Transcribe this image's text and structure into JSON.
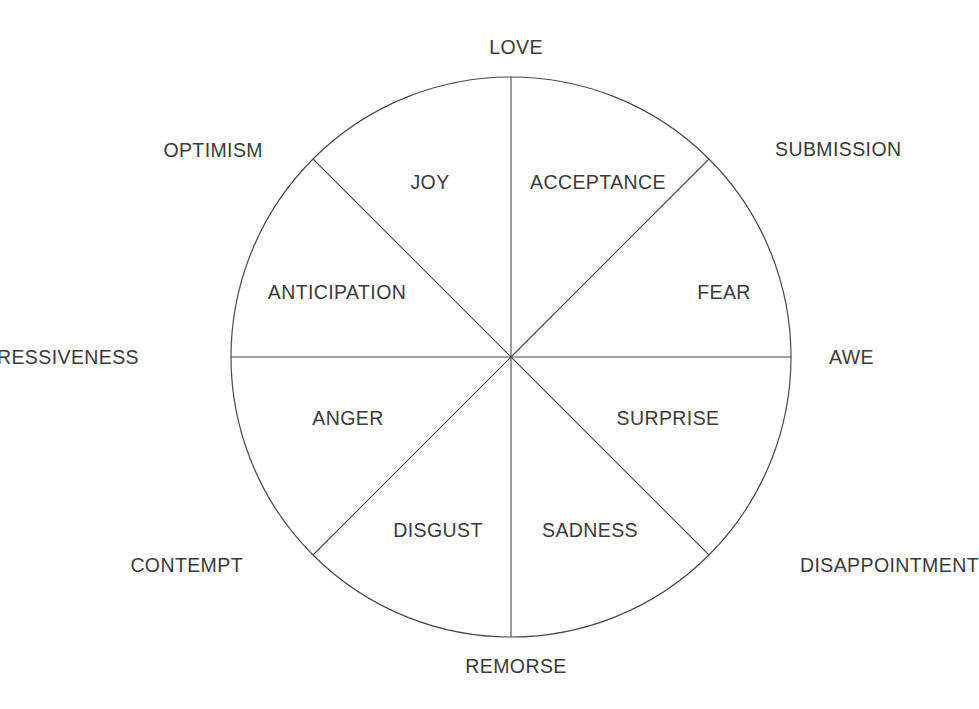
{
  "diagram": {
    "type": "emotion-wheel",
    "geometry": {
      "center_x": 511,
      "center_y": 357,
      "radius": 280,
      "spoke_count": 8,
      "spoke_angles_deg": [
        0,
        45,
        90,
        135,
        180,
        225,
        270,
        315
      ]
    },
    "colors": {
      "background": "#ffffff",
      "stroke": "#4a4a4a",
      "text": "#3b3b3b"
    },
    "primary_emotions": [
      {
        "label": "ACCEPTANCE",
        "sector_index": 0,
        "x": 598,
        "y": 183
      },
      {
        "label": "FEAR",
        "sector_index": 1,
        "x": 724,
        "y": 293
      },
      {
        "label": "SURPRISE",
        "sector_index": 2,
        "x": 668,
        "y": 419
      },
      {
        "label": "SADNESS",
        "sector_index": 3,
        "x": 590,
        "y": 531
      },
      {
        "label": "DISGUST",
        "sector_index": 4,
        "x": 438,
        "y": 531
      },
      {
        "label": "ANGER",
        "sector_index": 5,
        "x": 348,
        "y": 419
      },
      {
        "label": "ANTICIPATION",
        "sector_index": 6,
        "x": 337,
        "y": 293
      },
      {
        "label": "JOY",
        "sector_index": 7,
        "x": 430,
        "y": 183
      }
    ],
    "dyads": [
      {
        "label": "LOVE",
        "angle_deg": 90,
        "x": 516,
        "y": 48,
        "anchor": "center"
      },
      {
        "label": "SUBMISSION",
        "angle_deg": 45,
        "x": 775,
        "y": 150,
        "anchor": "left"
      },
      {
        "label": "AWE",
        "angle_deg": 0,
        "x": 829,
        "y": 358,
        "anchor": "left"
      },
      {
        "label": "DISAPPOINTMENT",
        "angle_deg": 315,
        "x": 800,
        "y": 566,
        "anchor": "left"
      },
      {
        "label": "REMORSE",
        "angle_deg": 270,
        "x": 516,
        "y": 667,
        "anchor": "center"
      },
      {
        "label": "CONTEMPT",
        "angle_deg": 225,
        "x": 243,
        "y": 566,
        "anchor": "right"
      },
      {
        "label": "AGGRESSIVENESS",
        "angle_deg": 180,
        "x": 139,
        "y": 358,
        "anchor": "right"
      },
      {
        "label": "OPTIMISM",
        "angle_deg": 135,
        "x": 263,
        "y": 151,
        "anchor": "right"
      }
    ]
  }
}
